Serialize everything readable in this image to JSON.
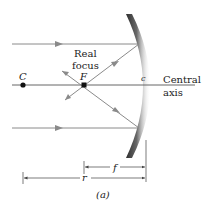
{
  "diagram": {
    "labels": {
      "real_focus_line1": "Real",
      "real_focus_line2": "focus",
      "center_point": "C",
      "focal_point": "F",
      "mirror_vertex": "c",
      "axis_line1": "Central",
      "axis_line2": "axis",
      "focal_length": "f",
      "radius": "r",
      "caption": "(a)"
    },
    "colors": {
      "ray": "#8a8a8a",
      "axis": "#555555",
      "mirror_dark": "#3a3a3a",
      "mirror_light": "#d8d8d8",
      "text": "#222222",
      "point": "#111111"
    }
  }
}
